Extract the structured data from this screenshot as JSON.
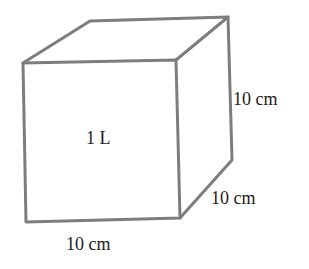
{
  "diagram": {
    "type": "cube",
    "volume_label": "1 L",
    "dimensions": {
      "height": "10 cm",
      "depth": "10 cm",
      "width": "10 cm"
    },
    "edge_color": "#7d7d7d"
  }
}
